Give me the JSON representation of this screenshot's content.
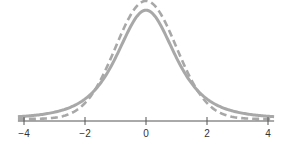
{
  "chart_data": {
    "type": "line",
    "title": "",
    "xlabel": "",
    "ylabel": "",
    "xlim": [
      -4.2,
      4.2
    ],
    "ylim": [
      0,
      0.4
    ],
    "grid": false,
    "legend": "none",
    "x_ticks": [
      -4,
      -2,
      0,
      2,
      4
    ],
    "x_tick_labels": [
      "−4",
      "−2",
      "0",
      "2",
      "4"
    ],
    "series": [
      {
        "name": "t-distribution (heavy tails)",
        "style": "solid",
        "color": "#a8a8a8",
        "distribution": "student-t",
        "df": 3,
        "x": [
          -4,
          -3,
          -2,
          -1.5,
          -1,
          -0.5,
          0,
          0.5,
          1,
          1.5,
          2,
          3,
          4
        ],
        "y": [
          0.009,
          0.023,
          0.068,
          0.116,
          0.207,
          0.313,
          0.368,
          0.313,
          0.207,
          0.116,
          0.068,
          0.023,
          0.009
        ]
      },
      {
        "name": "standard normal",
        "style": "dashed",
        "color": "#a8a8a8",
        "distribution": "normal",
        "x": [
          -4,
          -3,
          -2,
          -1.5,
          -1,
          -0.5,
          0,
          0.5,
          1,
          1.5,
          2,
          3,
          4
        ],
        "y": [
          0.0001,
          0.004,
          0.054,
          0.13,
          0.242,
          0.352,
          0.399,
          0.352,
          0.242,
          0.13,
          0.054,
          0.004,
          0.0001
        ]
      }
    ]
  }
}
